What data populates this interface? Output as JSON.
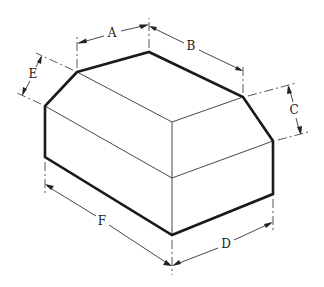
{
  "figure": {
    "dimensions": {
      "A": {
        "label": "A"
      },
      "B": {
        "label": "B"
      },
      "C": {
        "label": "C"
      },
      "D": {
        "label": "D"
      },
      "E": {
        "label": "E"
      },
      "F": {
        "label": "F"
      }
    }
  },
  "colors": {
    "background": "#ffffff",
    "line": "#1a1a1a"
  }
}
